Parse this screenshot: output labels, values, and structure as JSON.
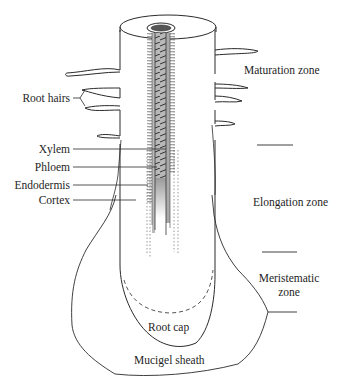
{
  "diagram": {
    "left_labels": [
      {
        "id": "root-hairs",
        "text": "Root hairs"
      },
      {
        "id": "xylem",
        "text": "Xylem"
      },
      {
        "id": "phloem",
        "text": "Phloem"
      },
      {
        "id": "endodermis",
        "text": "Endodermis"
      },
      {
        "id": "cortex",
        "text": "Cortex"
      }
    ],
    "zone_labels": [
      {
        "id": "maturation-zone",
        "text": "Maturation zone"
      },
      {
        "id": "elongation-zone",
        "text": "Elongation zone"
      },
      {
        "id": "meristematic-zone-line1",
        "text": "Meristematic"
      },
      {
        "id": "meristematic-zone-line2",
        "text": "zone"
      }
    ],
    "inner_labels": [
      {
        "id": "root-cap",
        "text": "Root cap"
      },
      {
        "id": "mucigel-sheath",
        "text": "Mucigel sheath"
      }
    ],
    "colors": {
      "line": "#2a2a2a",
      "vascular_fill": "#9a9a9a",
      "background": "#ffffff"
    }
  }
}
